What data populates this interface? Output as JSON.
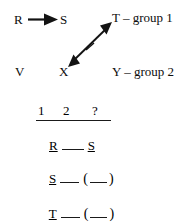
{
  "figure": {
    "background_color": "#ffffff",
    "ink_color": "#0d0d0d"
  },
  "diagram": {
    "nodes": [
      {
        "id": "R",
        "label": "R",
        "x": 14,
        "y": 14
      },
      {
        "id": "S",
        "label": "S",
        "x": 60,
        "y": 14
      },
      {
        "id": "T",
        "label": "T",
        "x": 113,
        "y": 12
      },
      {
        "id": "V",
        "label": "V",
        "x": 15,
        "y": 66
      },
      {
        "id": "X",
        "label": "X",
        "x": 59,
        "y": 66
      },
      {
        "id": "Y",
        "label": "Y",
        "x": 113,
        "y": 66
      }
    ],
    "annotations": [
      {
        "id": "T-group",
        "text": "T – group 1",
        "x": 113,
        "y": 12
      },
      {
        "id": "Y-group",
        "text": "Y – group 2",
        "x": 113,
        "y": 66
      }
    ],
    "group_labels": {
      "group1": "group 1",
      "group2": "group 2",
      "dash": "–"
    },
    "arrows": [
      {
        "id": "R-to-S",
        "from": "R",
        "to": "S",
        "style": "single-head-solid",
        "x1": 28,
        "y1": 20,
        "x2": 58,
        "y2": 20
      },
      {
        "id": "X-to-T",
        "from": "X",
        "to": "T",
        "style": "double-head-solid-with-tick",
        "x1": 70,
        "y1": 64,
        "x2": 110,
        "y2": 25,
        "tick": {
          "x": 90,
          "y": 44
        }
      }
    ]
  },
  "answer_table": {
    "header": {
      "columns": [
        "1",
        "2",
        "?"
      ],
      "column_x": [
        38,
        63,
        92
      ]
    },
    "rule": {
      "x": 36,
      "y": 120,
      "width": 75
    },
    "rows": [
      {
        "id": "row-R",
        "cells": [
          {
            "text": "R",
            "underlined": true
          },
          {
            "text": "",
            "underlined": true,
            "blank": true
          },
          {
            "text": "S",
            "underlined": true
          }
        ],
        "y": 122
      },
      {
        "id": "row-S",
        "cells": [
          {
            "text": "S",
            "underlined": true
          },
          {
            "text": "",
            "underlined": true,
            "blank": true
          },
          {
            "text": "(",
            "underlined": false
          },
          {
            "text": "",
            "underlined": true,
            "blank": true
          },
          {
            "text": ")",
            "underlined": false
          }
        ],
        "y": 155
      },
      {
        "id": "row-T",
        "cells": [
          {
            "text": "T",
            "underlined": true
          },
          {
            "text": "",
            "underlined": true,
            "blank": true
          },
          {
            "text": "(",
            "underlined": false
          },
          {
            "text": "",
            "underlined": true,
            "blank": true
          },
          {
            "text": ")",
            "underlined": false
          }
        ],
        "y": 190
      }
    ],
    "row_text": {
      "row_R": "R __ S",
      "row_S": "S __ (__)",
      "row_T": "T __ (__)"
    }
  }
}
